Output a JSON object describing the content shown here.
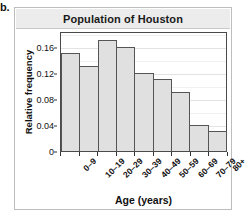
{
  "figure": {
    "label": "b."
  },
  "chart_data": {
    "type": "bar",
    "title": "Population of Houston",
    "xlabel": "Age (years)",
    "ylabel": "Relative frequency",
    "categories": [
      "0–9",
      "10–19",
      "20–29",
      "30–39",
      "40–49",
      "50–59",
      "60–69",
      "70–79",
      "80+"
    ],
    "values": [
      0.15,
      0.13,
      0.17,
      0.16,
      0.12,
      0.11,
      0.09,
      0.04,
      0.03
    ],
    "ylim": [
      0,
      0.184
    ],
    "yticks": [
      0,
      0.04,
      0.08,
      0.12,
      0.16
    ],
    "ytick_labels": [
      "0",
      "0.04",
      "0.08",
      "0.12",
      "0.16"
    ],
    "grid": true,
    "legend": false,
    "bar_fill": "#e0e0e0",
    "bar_edge": "#555555",
    "title_bar_color": "#ececec",
    "panel_border": "#bdbdbd"
  }
}
